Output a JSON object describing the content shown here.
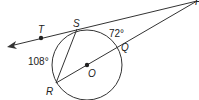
{
  "diagram": {
    "points": {
      "P": "P",
      "S": "S",
      "T": "T",
      "Q": "Q",
      "O": "O",
      "R": "R"
    },
    "arcs": {
      "SQ": "72°",
      "RS": "108°"
    },
    "colors": {
      "stroke": "#333333",
      "text": "#222222",
      "background": "#ffffff"
    }
  }
}
